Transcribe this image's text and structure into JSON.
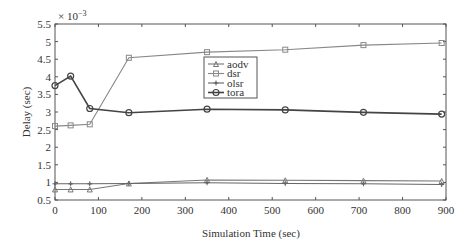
{
  "chart_data": {
    "type": "line",
    "title": "",
    "xlabel": "Simulation Time (sec)",
    "ylabel": "Delay (sec)",
    "y_multiplier": "× 10",
    "y_multiplier_exp": "−3",
    "xlim": [
      0,
      900
    ],
    "ylim": [
      0.5,
      5.5
    ],
    "xticks": [
      0,
      100,
      200,
      300,
      400,
      500,
      600,
      700,
      800,
      900
    ],
    "yticks": [
      0.5,
      1,
      1.5,
      2,
      2.5,
      3,
      3.5,
      4,
      4.5,
      5,
      5.5
    ],
    "ytick_labels": [
      "0.5",
      "1",
      "1.5",
      "2",
      "2.5",
      "3",
      "3.5",
      "4",
      "4.5",
      "5",
      "5.5"
    ],
    "grid": false,
    "legend_position": "center-upper",
    "x": [
      0,
      36,
      80,
      170,
      350,
      530,
      710,
      890
    ],
    "series": [
      {
        "name": "aodv",
        "marker": "triangle",
        "color": "#777777",
        "values": [
          0.8,
          0.8,
          0.8,
          0.97,
          1.07,
          1.06,
          1.05,
          1.04
        ]
      },
      {
        "name": "dsr",
        "marker": "square",
        "color": "#888888",
        "values": [
          2.6,
          2.62,
          2.65,
          4.54,
          4.7,
          4.77,
          4.9,
          4.96
        ]
      },
      {
        "name": "olsr",
        "marker": "star",
        "color": "#666666",
        "values": [
          0.96,
          0.96,
          0.96,
          0.97,
          0.99,
          0.97,
          0.96,
          0.94
        ]
      },
      {
        "name": "tora",
        "marker": "circle",
        "color": "#444444",
        "values": [
          3.75,
          4.02,
          3.1,
          2.98,
          3.08,
          3.06,
          2.99,
          2.94
        ]
      }
    ]
  }
}
